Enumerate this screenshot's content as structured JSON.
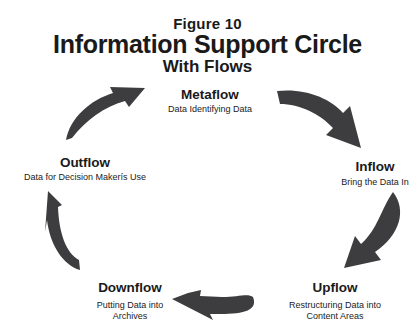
{
  "figure": {
    "label": "Figure 10",
    "title": "Information Support Circle",
    "subtitle": "With Flows"
  },
  "colors": {
    "arrow": "#3d3d3f",
    "text": "#1a1a1a",
    "background": "#ffffff"
  },
  "nodes": [
    {
      "id": "metaflow",
      "title": "Metaflow",
      "description": "Data Identifying Data"
    },
    {
      "id": "inflow",
      "title": "Inflow",
      "description": "Bring the Data In"
    },
    {
      "id": "upflow",
      "title": "Upflow",
      "description_lines": [
        "Restructuring Data into",
        "Content Areas"
      ]
    },
    {
      "id": "downflow",
      "title": "Downflow",
      "description_lines": [
        "Putting Data into",
        "Archives"
      ]
    },
    {
      "id": "outflow",
      "title": "Outflow",
      "description": "Data for Decision Makerís Use"
    }
  ],
  "arrows": [
    {
      "from": "metaflow",
      "to": "inflow",
      "icon": "curved-arrow-icon"
    },
    {
      "from": "inflow",
      "to": "upflow",
      "icon": "curved-arrow-icon"
    },
    {
      "from": "upflow",
      "to": "downflow",
      "icon": "curved-arrow-icon"
    },
    {
      "from": "downflow",
      "to": "outflow",
      "icon": "curved-arrow-icon"
    },
    {
      "from": "outflow",
      "to": "metaflow",
      "icon": "curved-arrow-icon"
    }
  ]
}
